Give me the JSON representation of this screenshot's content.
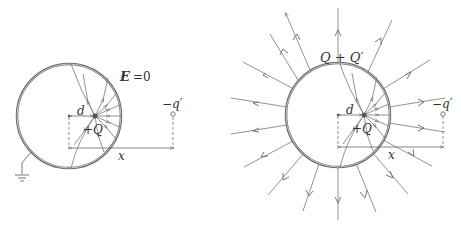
{
  "left_diagram": {
    "field_label": "E",
    "field_eq": "=0",
    "charge_label": "+Q",
    "distance_d": "d",
    "distance_x": "x",
    "image_charge": "−q′",
    "grounded": true
  },
  "right_diagram": {
    "total_charge_label": "Q + Q′",
    "charge_label": "+Q",
    "distance_d": "d",
    "distance_x": "x",
    "image_charge": "−q′",
    "outer_field_lines": 16
  },
  "colors": {
    "line": "#777777",
    "shell": "#666666",
    "text": "#333333"
  }
}
